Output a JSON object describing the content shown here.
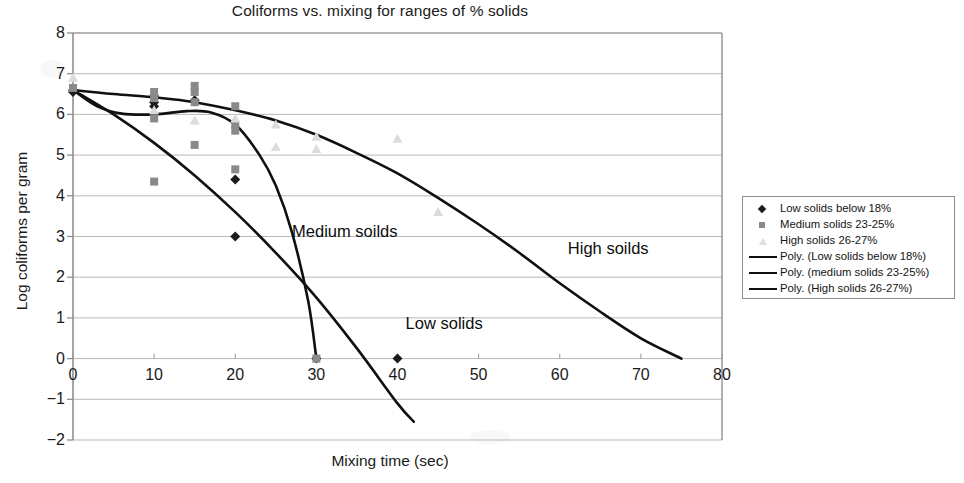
{
  "chart_data": {
    "type": "scatter",
    "title": "Coliforms vs. mixing for ranges of % solids",
    "xlabel": "Mixing time (sec)",
    "ylabel": "Log coliforms per gram",
    "xlim": [
      0,
      80
    ],
    "ylim": [
      -2,
      8
    ],
    "xticks": [
      "0",
      "10",
      "20",
      "30",
      "40",
      "50",
      "60",
      "70",
      "80"
    ],
    "yticks": [
      "8",
      "7",
      "6",
      "5",
      "4",
      "3",
      "2",
      "1",
      "0",
      "−1",
      "−2"
    ],
    "grid": "horizontal",
    "legend_position": "right-outside",
    "series": [
      {
        "name": "Low solids below 18%",
        "marker": "diamond",
        "color": "#1b1b1b",
        "points": [
          [
            0,
            6.6
          ],
          [
            0,
            6.55
          ],
          [
            10,
            6.45
          ],
          [
            10,
            6.3
          ],
          [
            10,
            6.2
          ],
          [
            15,
            6.35
          ],
          [
            20,
            4.4
          ],
          [
            20,
            3.0
          ],
          [
            30,
            0.0
          ],
          [
            40,
            0.0
          ]
        ]
      },
      {
        "name": "Medium solids 23-25%",
        "marker": "square",
        "color": "#8a8a8a",
        "points": [
          [
            0,
            6.65
          ],
          [
            10,
            6.55
          ],
          [
            10,
            6.4
          ],
          [
            10,
            5.9
          ],
          [
            10,
            4.35
          ],
          [
            15,
            6.7
          ],
          [
            15,
            6.55
          ],
          [
            15,
            6.3
          ],
          [
            15,
            5.25
          ],
          [
            20,
            6.2
          ],
          [
            20,
            5.75
          ],
          [
            20,
            5.6
          ],
          [
            20,
            4.65
          ],
          [
            30,
            0.0
          ]
        ]
      },
      {
        "name": "High solids 26-27%",
        "marker": "triangle",
        "color": "#dcdcdc",
        "points": [
          [
            0,
            6.9
          ],
          [
            10,
            6.1
          ],
          [
            15,
            5.85
          ],
          [
            20,
            5.9
          ],
          [
            25,
            5.75
          ],
          [
            25,
            5.2
          ],
          [
            30,
            5.45
          ],
          [
            30,
            5.15
          ],
          [
            40,
            5.4
          ],
          [
            45,
            3.6
          ]
        ]
      }
    ],
    "trendlines": [
      {
        "name": "Poly. (Low solids below 18%)",
        "color": "#101010",
        "path": [
          [
            0,
            6.6
          ],
          [
            5,
            6.0
          ],
          [
            10,
            5.3
          ],
          [
            15,
            4.5
          ],
          [
            20,
            3.6
          ],
          [
            25,
            2.6
          ],
          [
            30,
            1.5
          ],
          [
            35,
            0.25
          ],
          [
            40,
            -1.1
          ],
          [
            42,
            -1.55
          ]
        ]
      },
      {
        "name": "Poly. (medium solids 23-25%)",
        "color": "#101010",
        "path": [
          [
            0,
            6.6
          ],
          [
            3,
            6.2
          ],
          [
            6,
            6.02
          ],
          [
            10,
            6.0
          ],
          [
            14,
            6.08
          ],
          [
            17,
            6.05
          ],
          [
            20,
            5.75
          ],
          [
            23,
            5.0
          ],
          [
            25,
            4.25
          ],
          [
            27,
            3.1
          ],
          [
            29,
            1.4
          ],
          [
            30,
            0.0
          ]
        ]
      },
      {
        "name": "Poly. (High solids 26-27%)",
        "color": "#101010",
        "path": [
          [
            0,
            6.6
          ],
          [
            5,
            6.5
          ],
          [
            10,
            6.42
          ],
          [
            15,
            6.3
          ],
          [
            20,
            6.1
          ],
          [
            25,
            5.85
          ],
          [
            30,
            5.5
          ],
          [
            35,
            5.05
          ],
          [
            40,
            4.55
          ],
          [
            45,
            3.95
          ],
          [
            50,
            3.3
          ],
          [
            55,
            2.6
          ],
          [
            60,
            1.85
          ],
          [
            65,
            1.15
          ],
          [
            70,
            0.5
          ],
          [
            75,
            0.0
          ]
        ]
      }
    ],
    "annotations": [
      {
        "text": "Medium soilds",
        "x": 27,
        "y": 3.1
      },
      {
        "text": "Low solids",
        "x": 41,
        "y": 0.85
      },
      {
        "text": "High soilds",
        "x": 61,
        "y": 2.7
      }
    ]
  },
  "legend": {
    "entries": [
      {
        "label": "Low solids below 18%",
        "key": "diamond-marker"
      },
      {
        "label": "Medium solids 23-25%",
        "key": "square-marker"
      },
      {
        "label": "High solids 26-27%",
        "key": "triangle-marker"
      },
      {
        "label": "Poly. (Low solids below 18%)",
        "key": "line-swatch"
      },
      {
        "label": "Poly. (medium solids 23-25%)",
        "key": "line-swatch"
      },
      {
        "label": "Poly. (High solids 26-27%)",
        "key": "line-swatch"
      }
    ]
  }
}
